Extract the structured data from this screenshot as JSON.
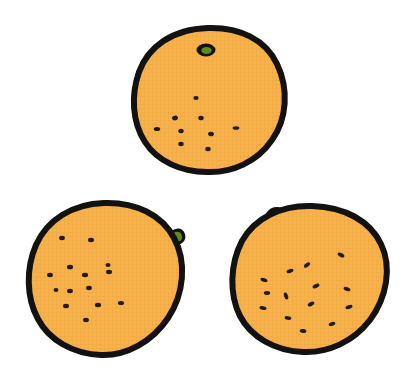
{
  "scene": {
    "title": "Three hand-drawn oranges",
    "width": 412,
    "height": 392,
    "background_color": "#FFFFFF",
    "count_label": "3"
  },
  "palette": {
    "peel_fill": "#F5B24E",
    "peel_fill_light": "#F8C06A",
    "outline": "#141210",
    "speck": "#241A0E",
    "stem_green": "#5E8A1E",
    "stem_green_dark": "#3E5E12",
    "texture_line": "#EFA63C"
  },
  "fruits": [
    {
      "id": "orange-top",
      "name": "top-orange",
      "label": "Orange (top)",
      "center_x": 208,
      "center_y": 100,
      "radius_x": 74,
      "radius_y": 72,
      "outline_width": 6,
      "stem": {
        "name": "stem-top",
        "type": "stem-blob",
        "x": 206,
        "y": 50,
        "rx": 9,
        "ry": 6
      },
      "specks": [
        {
          "x": 196,
          "y": 98,
          "rx": 2.6,
          "ry": 2.1,
          "rot": 0
        },
        {
          "x": 175,
          "y": 118,
          "rx": 3.0,
          "ry": 2.3,
          "rot": -12
        },
        {
          "x": 201,
          "y": 118,
          "rx": 2.8,
          "ry": 2.2,
          "rot": 4
        },
        {
          "x": 157,
          "y": 129,
          "rx": 3.2,
          "ry": 2.0,
          "rot": 0
        },
        {
          "x": 181,
          "y": 131,
          "rx": 2.7,
          "ry": 2.2,
          "rot": 0
        },
        {
          "x": 211,
          "y": 134,
          "rx": 3.0,
          "ry": 2.2,
          "rot": 10
        },
        {
          "x": 236,
          "y": 128,
          "rx": 3.4,
          "ry": 1.8,
          "rot": 0
        },
        {
          "x": 181,
          "y": 144,
          "rx": 2.7,
          "ry": 2.2,
          "rot": 0
        },
        {
          "x": 208,
          "y": 149,
          "rx": 2.7,
          "ry": 2.2,
          "rot": 0
        }
      ]
    },
    {
      "id": "orange-bottom-left",
      "name": "bottom-left-orange",
      "label": "Orange (bottom left)",
      "center_x": 105,
      "center_y": 279,
      "radius_x": 77,
      "radius_y": 76,
      "outline_width": 6,
      "stem": {
        "name": "stem-bottom-left",
        "type": "stem-nub-right",
        "x": 178,
        "y": 232,
        "rx": 8,
        "ry": 7
      },
      "specks": [
        {
          "x": 62,
          "y": 238,
          "rx": 2.9,
          "ry": 2.2,
          "rot": 0
        },
        {
          "x": 91,
          "y": 240,
          "rx": 3.0,
          "ry": 2.2,
          "rot": 0
        },
        {
          "x": 70,
          "y": 267,
          "rx": 3.1,
          "ry": 2.3,
          "rot": 0
        },
        {
          "x": 50,
          "y": 275,
          "rx": 2.9,
          "ry": 2.2,
          "rot": 0
        },
        {
          "x": 85,
          "y": 275,
          "rx": 3.1,
          "ry": 2.2,
          "rot": 0
        },
        {
          "x": 109,
          "y": 272,
          "rx": 3.0,
          "ry": 2.2,
          "rot": 0
        },
        {
          "x": 89,
          "y": 288,
          "rx": 2.9,
          "ry": 2.2,
          "rot": 0
        },
        {
          "x": 70,
          "y": 291,
          "rx": 2.9,
          "ry": 2.2,
          "rot": 0
        },
        {
          "x": 66,
          "y": 306,
          "rx": 3.0,
          "ry": 2.2,
          "rot": 0
        },
        {
          "x": 98,
          "y": 305,
          "rx": 3.1,
          "ry": 2.2,
          "rot": 0
        },
        {
          "x": 121,
          "y": 303,
          "rx": 3.1,
          "ry": 2.1,
          "rot": 0
        },
        {
          "x": 86,
          "y": 320,
          "rx": 2.9,
          "ry": 2.2,
          "rot": 0
        },
        {
          "x": 108,
          "y": 265,
          "rx": 2.5,
          "ry": 2.0,
          "rot": 0
        },
        {
          "x": 56,
          "y": 290,
          "rx": 2.4,
          "ry": 2.0,
          "rot": 0
        }
      ]
    },
    {
      "id": "orange-bottom-right",
      "name": "bottom-right-orange",
      "label": "Orange (bottom right)",
      "center_x": 310,
      "center_y": 279,
      "radius_x": 78,
      "radius_y": 73,
      "rotation": -8,
      "outline_width": 6,
      "stem": {
        "name": "stem-bottom-right",
        "type": "stem-leaf-left",
        "x": 275,
        "y": 213,
        "rx": 9,
        "ry": 7
      },
      "specks": [
        {
          "x": 307,
          "y": 265,
          "rx": 3.6,
          "ry": 1.9,
          "rot": -38
        },
        {
          "x": 341,
          "y": 255,
          "rx": 3.6,
          "ry": 1.9,
          "rot": 28
        },
        {
          "x": 290,
          "y": 271,
          "rx": 3.6,
          "ry": 1.9,
          "rot": -20
        },
        {
          "x": 264,
          "y": 280,
          "rx": 3.6,
          "ry": 1.9,
          "rot": 16
        },
        {
          "x": 316,
          "y": 286,
          "rx": 3.6,
          "ry": 1.9,
          "rot": -24
        },
        {
          "x": 286,
          "y": 296,
          "rx": 3.6,
          "ry": 2.0,
          "rot": 72
        },
        {
          "x": 347,
          "y": 289,
          "rx": 3.6,
          "ry": 1.9,
          "rot": 22
        },
        {
          "x": 311,
          "y": 304,
          "rx": 3.6,
          "ry": 1.9,
          "rot": -30
        },
        {
          "x": 263,
          "y": 308,
          "rx": 3.6,
          "ry": 1.9,
          "rot": 14
        },
        {
          "x": 349,
          "y": 307,
          "rx": 3.6,
          "ry": 1.9,
          "rot": -16
        },
        {
          "x": 288,
          "y": 318,
          "rx": 3.4,
          "ry": 1.9,
          "rot": 10
        },
        {
          "x": 332,
          "y": 324,
          "rx": 3.4,
          "ry": 1.9,
          "rot": -18
        },
        {
          "x": 303,
          "y": 331,
          "rx": 3.4,
          "ry": 1.9,
          "rot": 8
        },
        {
          "x": 267,
          "y": 293,
          "rx": 3.2,
          "ry": 1.9,
          "rot": 0
        }
      ]
    }
  ]
}
